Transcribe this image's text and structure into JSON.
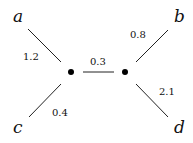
{
  "tree": {
    "leaves": {
      "a": "a",
      "b": "b",
      "c": "c",
      "d": "d"
    },
    "weights": {
      "a_edge": "1.2",
      "internal_edge": "0.3",
      "b_edge": "0.8",
      "d_edge": "2.1",
      "c_edge": "0.4"
    }
  },
  "colors": {
    "line": "#222222",
    "node": "#000000"
  }
}
